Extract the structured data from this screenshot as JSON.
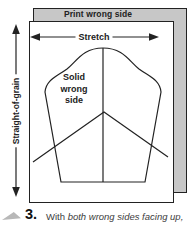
{
  "figure": {
    "back_layer_label": "Print wrong side",
    "stretch_label": "Stretch",
    "grain_label": "Straight-of-grain",
    "pattern_label_lines": [
      "Solid",
      "wrong",
      "side"
    ],
    "colors": {
      "fabric_gray": "#c7c7c7",
      "line_dark": "#222222",
      "caption_gray": "#3d3d3d",
      "marker_gray": "#b8b8b8"
    }
  },
  "caption": {
    "step_number": "3.",
    "text_regular": "With",
    "text_italic": "both wrong sides facing up,"
  }
}
